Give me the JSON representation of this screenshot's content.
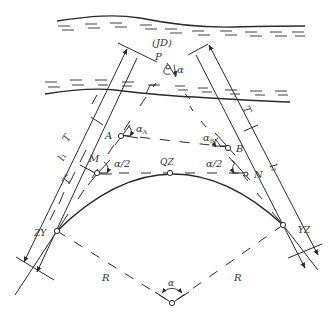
{
  "labels": {
    "jd": "(JD)",
    "p": "P",
    "alpha_top": "α",
    "t_left": "T",
    "l1": "l₁",
    "t_prime": "T'",
    "a": "A",
    "alpha_a": "α",
    "alpha_a_sub": "A",
    "b": "B",
    "alpha_b": "α",
    "alpha_b_sub": "B",
    "m": "M",
    "alpha_half_left": "α/2",
    "qz": "QZ",
    "alpha_half_right": "α/2",
    "n": "N",
    "t_right": "T",
    "l2": "l₂",
    "zy": "ZY",
    "yz": "YZ",
    "r_left": "R",
    "r_right": "R",
    "alpha_center": "α"
  },
  "colors": {
    "line": "#2a2a2a",
    "text": "#333333"
  }
}
